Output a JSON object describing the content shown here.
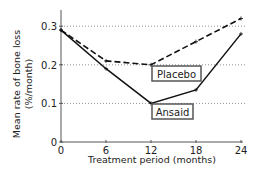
{
  "chart_data": {
    "type": "line",
    "title": "",
    "xlabel": "Treatment period (months)",
    "ylabel_line1": "Mean rate of bone loss",
    "ylabel_line2": "(%/month)",
    "x": [
      0,
      6,
      12,
      18,
      24
    ],
    "xlim": [
      0,
      24
    ],
    "ylim": [
      0,
      0.34
    ],
    "xticks": [
      "0",
      "6",
      "12",
      "18",
      "24"
    ],
    "yticks": [
      "0",
      "0.1",
      "0.2",
      "0.3"
    ],
    "grid": "horizontal dotted at 0.1, 0.2, 0.3",
    "series": [
      {
        "name": "Placebo",
        "style": "dashed",
        "values": [
          0.29,
          0.21,
          0.2,
          0.26,
          0.32
        ]
      },
      {
        "name": "Ansaid",
        "style": "solid",
        "values": [
          0.29,
          0.19,
          0.1,
          0.135,
          0.28
        ]
      }
    ],
    "annotations": [
      "Placebo",
      "Ansaid"
    ]
  }
}
